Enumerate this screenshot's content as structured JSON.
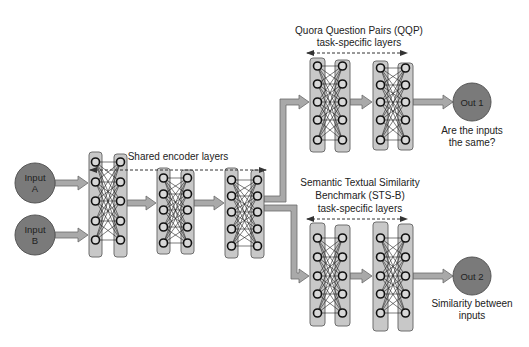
{
  "colors": {
    "background": "#ffffff",
    "layer_fill": "#c8c8c8",
    "layer_stroke": "#6e6e6e",
    "node_stroke": "#111111",
    "node_fill": "#d8d8d8",
    "arrow_fill": "#a9a9a9",
    "arrow_stroke": "#6a6a6a",
    "io_circle_fill": "#7a7a7a",
    "io_circle_stroke": "#555555",
    "text": "#222222",
    "dashed": "#333333"
  },
  "inputs": [
    {
      "id": "A",
      "line1": "Input",
      "line2": "A"
    },
    {
      "id": "B",
      "line1": "Input",
      "line2": "B"
    }
  ],
  "shared_encoder": {
    "label": "Shared encoder layers",
    "blocks": 3
  },
  "tasks": [
    {
      "id": "qqp",
      "label_lines": [
        "Quora Question Pairs (QQP)",
        "task-specific layers"
      ],
      "output": {
        "label": "Out 1",
        "description_lines": [
          "Are the inputs",
          "the same?"
        ]
      }
    },
    {
      "id": "stsb",
      "label_lines": [
        "Semantic Textual Similarity",
        "Benchmark (STS-B)",
        "task-specific layers"
      ],
      "output": {
        "label": "Out 2",
        "description_lines": [
          "Similarity between",
          "inputs"
        ]
      }
    }
  ]
}
